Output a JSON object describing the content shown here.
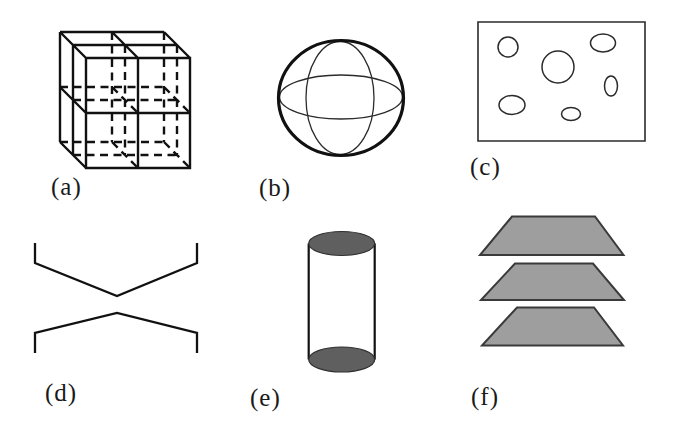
{
  "figure": {
    "panels": [
      {
        "label": "(a)",
        "shape": "subdivided-cube"
      },
      {
        "label": "(b)",
        "shape": "sphere-with-meridians"
      },
      {
        "label": "(c)",
        "shape": "rectangle-with-ellipses"
      },
      {
        "label": "(d)",
        "shape": "mirrored-angled-polylines"
      },
      {
        "label": "(e)",
        "shape": "cylinder-shaded-caps"
      },
      {
        "label": "(f)",
        "shape": "stacked-trapezoids"
      }
    ],
    "colors": {
      "line": "#111111",
      "thin_line": "#2b2b2b",
      "cylinder_cap_fill": "#5f5f5f",
      "trapezoid_fill": "#9e9e9e",
      "trapezoid_outline": "#3a3a3a",
      "background": "#ffffff"
    }
  }
}
